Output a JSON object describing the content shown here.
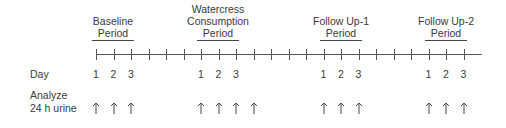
{
  "periods": [
    {
      "lines": [
        "",
        "Baseline",
        "Period"
      ],
      "center_x": 113
    },
    {
      "lines": [
        "Watercress",
        "Consumption",
        "Period"
      ],
      "center_x": 218
    },
    {
      "lines": [
        "",
        "Follow Up-1",
        "Period"
      ],
      "center_x": 341
    },
    {
      "lines": [
        "",
        "Follow Up-2",
        "Period"
      ],
      "center_x": 446
    }
  ],
  "row_labels": {
    "day": "Day",
    "analyze_line1": "Analyze",
    "analyze_line2": "24 h urine"
  },
  "timeline": {
    "tick_count": 22,
    "tick_x": [
      96,
      113.5,
      131,
      148.5,
      166,
      183.5,
      201,
      218.5,
      236,
      253.5,
      271,
      288.5,
      306,
      323.5,
      341,
      358.5,
      376,
      393.5,
      411,
      428.5,
      446,
      463.5
    ]
  },
  "days": [
    {
      "label": "1",
      "x": 96
    },
    {
      "label": "2",
      "x": 113.5
    },
    {
      "label": "3",
      "x": 131
    },
    {
      "label": "1",
      "x": 201
    },
    {
      "label": "2",
      "x": 218.5
    },
    {
      "label": "3",
      "x": 236
    },
    {
      "label": "1",
      "x": 323.5
    },
    {
      "label": "2",
      "x": 341
    },
    {
      "label": "3",
      "x": 358.5
    },
    {
      "label": "1",
      "x": 428.5
    },
    {
      "label": "2",
      "x": 446
    },
    {
      "label": "3",
      "x": 463.5
    }
  ],
  "urine_arrows_x": [
    96,
    113.5,
    131,
    201,
    218.5,
    236,
    253.5,
    323.5,
    341,
    358.5,
    428.5,
    446,
    463.5
  ],
  "colors": {
    "line": "#555555",
    "text": "#3a3a3a"
  }
}
